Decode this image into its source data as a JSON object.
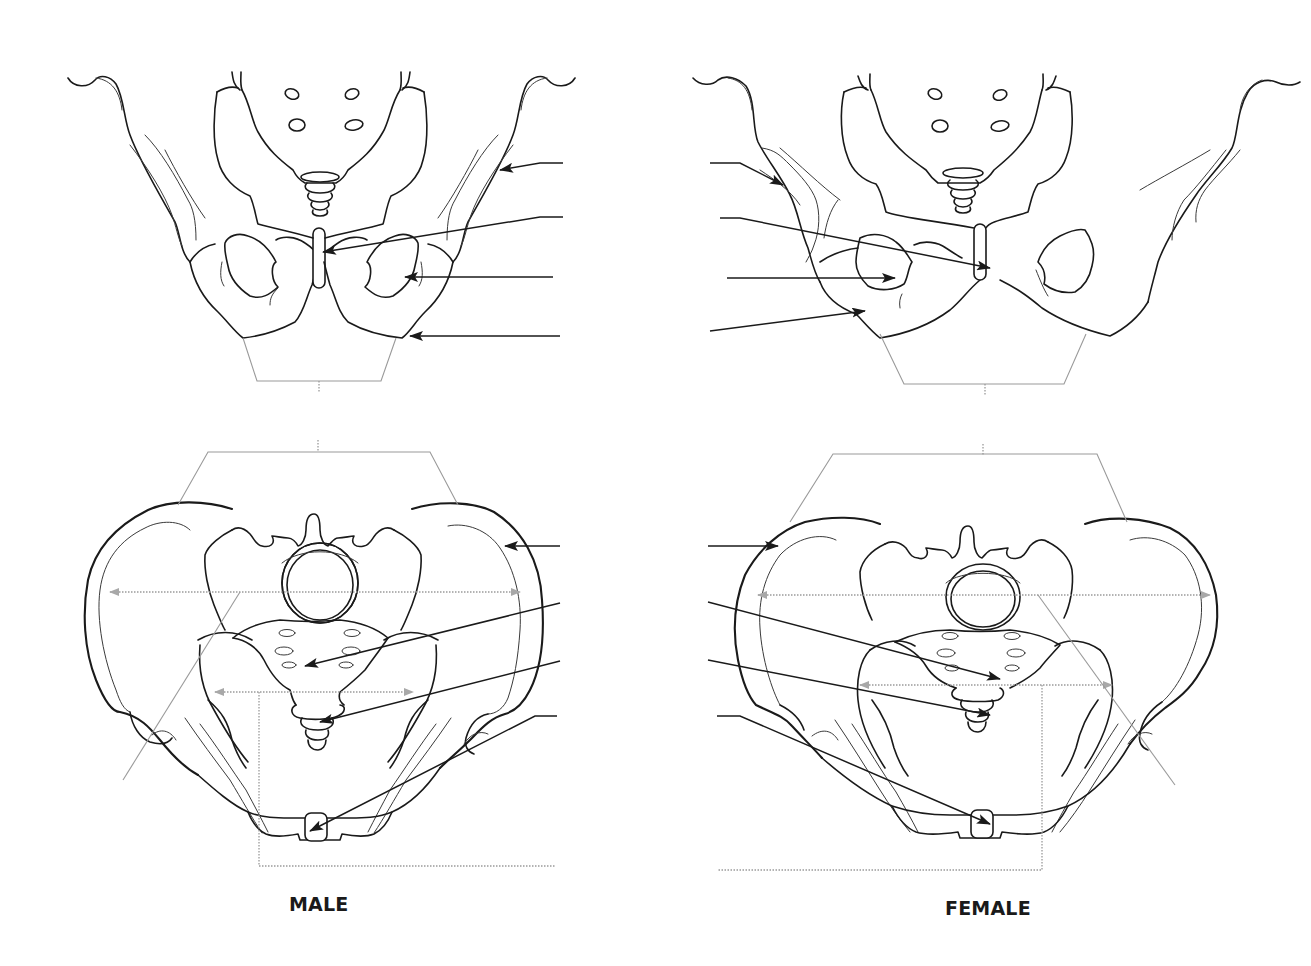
{
  "diagram": {
    "panels": [
      {
        "id": "male-anterior",
        "sex_label_ref": "captions.male",
        "view": "anterior"
      },
      {
        "id": "female-anterior",
        "sex_label_ref": "captions.female",
        "view": "anterior"
      },
      {
        "id": "male-superior",
        "sex_label_ref": "captions.male",
        "view": "superior"
      },
      {
        "id": "female-superior",
        "sex_label_ref": "captions.female",
        "view": "superior"
      }
    ],
    "callouts": {
      "male_anterior": [
        {
          "label": "",
          "line": [
            [
              563,
              163
            ],
            [
              540,
              163
            ],
            [
              500,
              170
            ]
          ]
        },
        {
          "label": "",
          "line": [
            [
              563,
              217
            ],
            [
              540,
              217
            ],
            [
              323,
              252
            ]
          ]
        },
        {
          "label": "",
          "line": [
            [
              553,
              277
            ],
            [
              405,
              277
            ]
          ]
        },
        {
          "label": "",
          "line": [
            [
              560,
              336
            ],
            [
              410,
              336
            ]
          ]
        }
      ],
      "female_anterior": [
        {
          "label": "",
          "line": [
            [
              710,
              163
            ],
            [
              740,
              163
            ],
            [
              783,
              185
            ]
          ]
        },
        {
          "label": "",
          "line": [
            [
              720,
              218
            ],
            [
              740,
              218
            ],
            [
              990,
              268
            ]
          ]
        },
        {
          "label": "",
          "line": [
            [
              727,
              278
            ],
            [
              895,
              278
            ]
          ]
        },
        {
          "label": "",
          "line": [
            [
              710,
              331
            ],
            [
              865,
              311
            ]
          ]
        }
      ],
      "male_superior": [
        {
          "label": "",
          "line": [
            [
              560,
              546
            ],
            [
              505,
              546
            ]
          ]
        },
        {
          "label": "",
          "line": [
            [
              560,
              603
            ],
            [
              305,
              666
            ]
          ]
        },
        {
          "label": "",
          "line": [
            [
              560,
              661
            ],
            [
              320,
              722
            ]
          ]
        },
        {
          "label": "",
          "line": [
            [
              557,
              716
            ],
            [
              535,
              716
            ],
            [
              310,
              831
            ]
          ]
        }
      ],
      "female_superior": [
        {
          "label": "",
          "line": [
            [
              708,
              546
            ],
            [
              778,
              546
            ]
          ]
        },
        {
          "label": "",
          "line": [
            [
              708,
              602
            ],
            [
              1000,
              679
            ]
          ]
        },
        {
          "label": "",
          "line": [
            [
              708,
              660
            ],
            [
              990,
              715
            ]
          ]
        },
        {
          "label": "",
          "line": [
            [
              717,
              716
            ],
            [
              740,
              716
            ],
            [
              990,
              824
            ]
          ]
        }
      ]
    }
  },
  "captions": {
    "male": "MALE",
    "female": "FEMALE"
  },
  "colors": {
    "ink": "#1a1a1a",
    "guide": "#9a9a9a",
    "background": "#ffffff"
  }
}
